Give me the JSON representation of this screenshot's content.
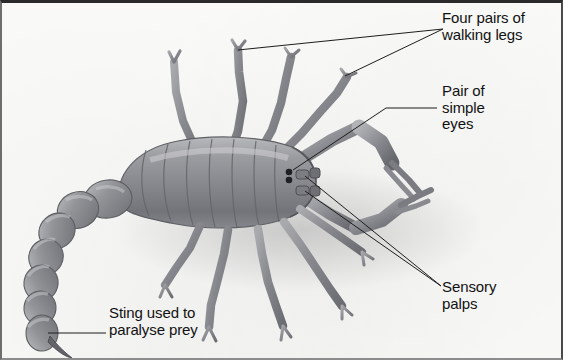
{
  "figure": {
    "background_color": "#fbfbfa",
    "frame_color": "#2a2a2a",
    "text_color": "#111111",
    "body_color": "#8f9094",
    "leader_line_color": "#1d1d1d"
  },
  "labels": {
    "walking_legs": "Four pairs of\nwalking legs",
    "simple_eyes": "Pair of\nsimple\neyes",
    "sensory_palps": "Sensory\npalps",
    "sting": "Sting used to\nparalyse prey"
  },
  "annotations": [
    {
      "id": "walking-legs",
      "text": "Four pairs of walking legs",
      "anchor_x": 443,
      "anchor_y": 29,
      "targets": [
        [
          238,
          50
        ],
        [
          345,
          76
        ]
      ]
    },
    {
      "id": "simple-eyes",
      "text": "Pair of simple eyes",
      "anchor_x": 437,
      "anchor_y": 108,
      "targets": [
        [
          293,
          170
        ]
      ]
    },
    {
      "id": "sensory-palps",
      "text": "Sensory palps",
      "anchor_x": 441,
      "anchor_y": 286,
      "targets": [
        [
          305,
          176
        ],
        [
          305,
          191
        ]
      ]
    },
    {
      "id": "sting",
      "text": "Sting used to paralyse prey",
      "anchor_x": 106,
      "anchor_y": 333,
      "targets": [
        [
          48,
          333
        ]
      ]
    }
  ],
  "anatomy": {
    "parts": [
      "mesosoma-segmented-abdomen",
      "metasoma-tail",
      "telson-sting",
      "pedipalp-pincers",
      "walking-legs",
      "simple-eyes",
      "sensory-palps"
    ],
    "tail_segment_count": 7,
    "abdomen_segment_count": 9,
    "walking_leg_pairs": 4
  }
}
